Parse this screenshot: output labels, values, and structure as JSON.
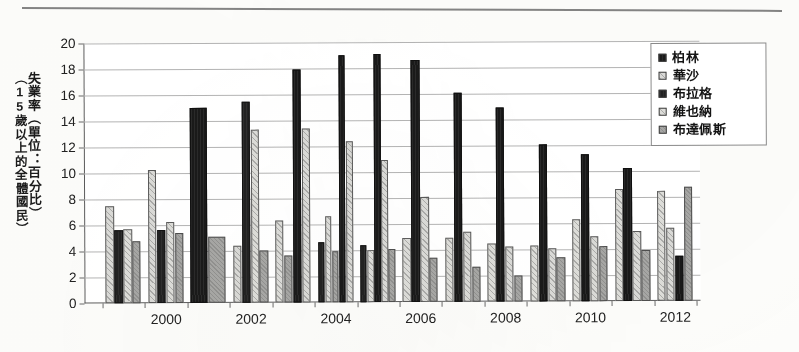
{
  "figure": {
    "ylabel_main": "失業率（單位：百分比）",
    "ylabel_sub": "（15歲以上的全體國民）"
  },
  "legend": {
    "items": [
      {
        "label": "柏林",
        "color": "#1b1b1b",
        "swatch": "solid-black-square"
      },
      {
        "label": "華沙",
        "color": "#d9d9d6",
        "swatch": "light-hatched-square"
      },
      {
        "label": "布拉格",
        "color": "#232323",
        "swatch": "dark-square"
      },
      {
        "label": "維也納",
        "color": "#dcdcd8",
        "swatch": "light-hatched-square"
      },
      {
        "label": "布達佩斯",
        "color": "#a6a6a4",
        "swatch": "grey-square"
      }
    ]
  },
  "chart_data": {
    "type": "bar",
    "title": "",
    "subtitle": "",
    "xlabel": "",
    "ylabel": "失業率（單位：百分比）（15歲以上的全體國民）",
    "ylim": [
      0,
      20
    ],
    "ytick_step": 2,
    "yticks": [
      0,
      2,
      4,
      6,
      8,
      10,
      12,
      14,
      16,
      18,
      20
    ],
    "grid": true,
    "legend_position": "top-right",
    "categories": [
      1999,
      2000,
      2001,
      2002,
      2003,
      2004,
      2005,
      2006,
      2007,
      2008,
      2009,
      2010,
      2011,
      2012
    ],
    "xtick_labels": [
      "2000",
      "2002",
      "2004",
      "2006",
      "2008",
      "2010",
      "2012"
    ],
    "xtick_categories": [
      2000,
      2002,
      2004,
      2006,
      2008,
      2010,
      2012
    ],
    "series": [
      {
        "name": "柏林",
        "values": [
          null,
          null,
          null,
          null,
          null,
          null,
          null,
          null,
          null,
          null,
          null,
          null,
          null,
          null
        ]
      },
      {
        "name": "華沙",
        "values": [
          7.5,
          10.2,
          4.4,
          null,
          null,
          null,
          null,
          4.9,
          4.9,
          4.5,
          4.3,
          6.3,
          null,
          8.5
        ]
      },
      {
        "name": "布拉格",
        "values": [
          5.6,
          5.6,
          15.5,
          17.9,
          19.0,
          19.1,
          18.6,
          16.1,
          14.9,
          12.1,
          11.3,
          10.2,
          null,
          null
        ]
      },
      {
        "name": "維也納",
        "values": [
          5.7,
          6.2,
          null,
          13.4,
          13.4,
          12.4,
          10.9,
          8.1,
          5.4,
          4.2,
          4.1,
          5.0,
          5.4,
          5.6
        ]
      },
      {
        "name": "布達佩斯",
        "values": [
          4.8,
          5.4,
          null,
          4.0,
          4.6,
          4.4,
          4.0,
          3.4,
          2.7,
          2.0,
          3.4,
          4.2,
          3.9,
          3.5
        ]
      }
    ],
    "groups": [
      {
        "year": 1999,
        "bars": [
          {
            "series": "華沙",
            "si": 1,
            "value": 7.5
          },
          {
            "series": "布拉格",
            "si": 2,
            "value": 5.6
          },
          {
            "series": "維也納",
            "si": 3,
            "value": 5.7
          },
          {
            "series": "布達佩斯",
            "si": 4,
            "value": 4.8
          }
        ]
      },
      {
        "year": 2000,
        "bars": [
          {
            "series": "華沙",
            "si": 1,
            "value": 10.2
          },
          {
            "series": "布拉格",
            "si": 2,
            "value": 5.6
          },
          {
            "series": "維也納",
            "si": 3,
            "value": 6.2
          },
          {
            "series": "布達佩斯",
            "si": 4,
            "value": 5.4
          }
        ]
      },
      {
        "year": 2001,
        "bars": [
          {
            "series": "柏林",
            "si": 0,
            "value": 15.0
          },
          {
            "series": "布達佩斯",
            "si": 4,
            "value": 5.1
          }
        ]
      },
      {
        "year": 2002,
        "bars": [
          {
            "series": "華沙",
            "si": 1,
            "value": 4.4
          },
          {
            "series": "布拉格",
            "si": 2,
            "value": 15.5
          },
          {
            "series": "維也納",
            "si": 3,
            "value": 13.3
          },
          {
            "series": "布達佩斯",
            "si": 4,
            "value": 4.0
          }
        ]
      },
      {
        "year": 2003,
        "bars": [
          {
            "series": "維也納",
            "si": 3,
            "value": 6.3
          },
          {
            "series": "布達佩斯",
            "si": 4,
            "value": 3.6
          },
          {
            "series": "柏林",
            "si": 0,
            "value": 17.9
          },
          {
            "series": "華沙",
            "si": 1,
            "value": 13.4
          }
        ]
      },
      {
        "year": 2004,
        "bars": [
          {
            "series": "布拉格",
            "si": 2,
            "value": 4.6
          },
          {
            "series": "維也納",
            "si": 3,
            "value": 6.6
          },
          {
            "series": "布達佩斯",
            "si": 4,
            "value": 3.9
          },
          {
            "series": "柏林",
            "si": 0,
            "value": 19.0
          },
          {
            "series": "華沙",
            "si": 1,
            "value": 12.4
          }
        ]
      },
      {
        "year": 2005,
        "bars": [
          {
            "series": "布拉格",
            "si": 2,
            "value": 4.4
          },
          {
            "series": "維也納",
            "si": 3,
            "value": 4.0
          },
          {
            "series": "柏林",
            "si": 0,
            "value": 19.1
          },
          {
            "series": "華沙",
            "si": 1,
            "value": 10.9
          },
          {
            "series": "布達佩斯",
            "si": 4,
            "value": 4.1
          }
        ]
      },
      {
        "year": 2006,
        "bars": [
          {
            "series": "維也納",
            "si": 3,
            "value": 4.9
          },
          {
            "series": "柏林",
            "si": 0,
            "value": 18.6
          },
          {
            "series": "華沙",
            "si": 1,
            "value": 8.1
          },
          {
            "series": "布達佩斯",
            "si": 4,
            "value": 3.4
          }
        ]
      },
      {
        "year": 2007,
        "bars": [
          {
            "series": "維也納",
            "si": 3,
            "value": 4.9
          },
          {
            "series": "柏林",
            "si": 0,
            "value": 16.1
          },
          {
            "series": "華沙",
            "si": 1,
            "value": 5.4
          },
          {
            "series": "布達佩斯",
            "si": 4,
            "value": 2.7
          }
        ]
      },
      {
        "year": 2008,
        "bars": [
          {
            "series": "維也納",
            "si": 3,
            "value": 4.5
          },
          {
            "series": "柏林",
            "si": 0,
            "value": 14.9
          },
          {
            "series": "華沙",
            "si": 1,
            "value": 4.2
          },
          {
            "series": "布達佩斯",
            "si": 4,
            "value": 2.0
          }
        ]
      },
      {
        "year": 2009,
        "bars": [
          {
            "series": "維也納",
            "si": 3,
            "value": 4.3
          },
          {
            "series": "柏林",
            "si": 0,
            "value": 12.1
          },
          {
            "series": "華沙",
            "si": 1,
            "value": 4.1
          },
          {
            "series": "布達佩斯",
            "si": 4,
            "value": 3.4
          }
        ]
      },
      {
        "year": 2010,
        "bars": [
          {
            "series": "維也納",
            "si": 3,
            "value": 6.3
          },
          {
            "series": "柏林",
            "si": 0,
            "value": 11.3
          },
          {
            "series": "華沙",
            "si": 1,
            "value": 5.0
          },
          {
            "series": "布達佩斯",
            "si": 4,
            "value": 4.2
          }
        ]
      },
      {
        "year": 2011,
        "bars": [
          {
            "series": "維也納",
            "si": 3,
            "value": 8.6
          },
          {
            "series": "柏林",
            "si": 0,
            "value": 10.2
          },
          {
            "series": "華沙",
            "si": 1,
            "value": 5.4
          },
          {
            "series": "布達佩斯",
            "si": 4,
            "value": 3.9
          }
        ]
      },
      {
        "year": 2012,
        "bars": [
          {
            "series": "維也納",
            "si": 3,
            "value": 8.5
          },
          {
            "series": "華沙",
            "si": 1,
            "value": 5.6
          },
          {
            "series": "柏林",
            "si": 0,
            "value": 3.5
          },
          {
            "series": "布達佩斯",
            "si": 4,
            "value": 8.8
          }
        ]
      }
    ]
  }
}
